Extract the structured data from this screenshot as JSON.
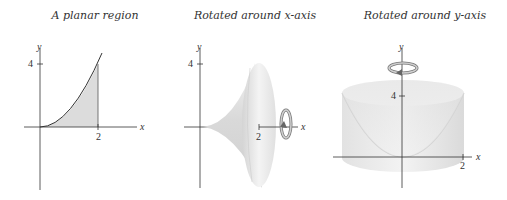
{
  "panels": [
    {
      "title": "A planar region",
      "x_label": "x",
      "y_label": "y",
      "x_tick": "2",
      "y_tick": "4",
      "curve": "y = x^2",
      "region": "0 ≤ x ≤ 2"
    },
    {
      "title": "Rotated around x-axis",
      "x_label": "x",
      "y_label": "y",
      "x_tick": "2",
      "y_tick": "4",
      "rotation_axis": "x"
    },
    {
      "title": "Rotated around y-axis",
      "x_label": "x",
      "y_label": "y",
      "x_tick": "2",
      "y_tick": "4",
      "rotation_axis": "y"
    }
  ],
  "colors": {
    "axis": "#333333",
    "region_fill": "#dcdcdc",
    "solid_fill": "#e6e6e6"
  }
}
